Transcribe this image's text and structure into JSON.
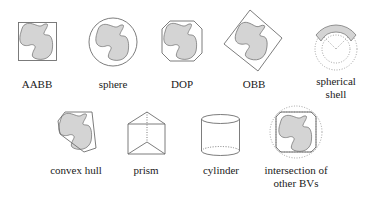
{
  "figure": {
    "colors": {
      "stroke": "#6e6e6e",
      "shape_fill": "#d4d4d4",
      "shape_stroke": "#7a7a7a",
      "text": "#1a1a1a"
    },
    "items": [
      {
        "id": "aabb",
        "label": "AABB"
      },
      {
        "id": "sphere",
        "label": "sphere"
      },
      {
        "id": "dop",
        "label": "DOP"
      },
      {
        "id": "obb",
        "label": "OBB"
      },
      {
        "id": "spherical-shell",
        "label_line1": "spherical",
        "label_line2": "shell"
      },
      {
        "id": "convex-hull",
        "label": "convex hull"
      },
      {
        "id": "prism",
        "label": "prism"
      },
      {
        "id": "cylinder",
        "label": "cylinder"
      },
      {
        "id": "intersection",
        "label_line1": "intersection of",
        "label_line2": "other BVs"
      }
    ]
  }
}
